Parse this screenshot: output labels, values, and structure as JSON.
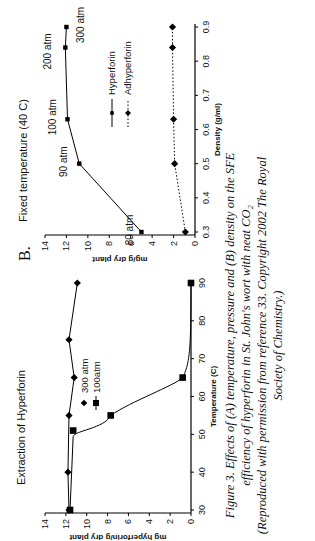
{
  "chart_data": [
    {
      "panel": "A",
      "type": "line",
      "title": "Extraction of Hyperforin",
      "xlabel": "Temperature (C)",
      "ylabel": "mg hyperforin/g dry plant",
      "xlim": [
        30,
        90
      ],
      "ylim": [
        0,
        14
      ],
      "xticks": [
        "30",
        "40",
        "50",
        "60",
        "70",
        "80",
        "90"
      ],
      "yticks": [
        "0",
        "2",
        "4",
        "6",
        "8",
        "10",
        "12",
        "14"
      ],
      "grid": false,
      "legend_position": "upper right",
      "series": [
        {
          "name": "300 atm",
          "marker": "diamond",
          "x": [
            30,
            40,
            55,
            65,
            75,
            90
          ],
          "y": [
            11.7,
            11.8,
            11.7,
            11.2,
            11.7,
            10.9
          ]
        },
        {
          "name": "100atm",
          "marker": "square",
          "x": [
            30,
            51,
            55,
            65,
            90
          ],
          "y": [
            11.6,
            11.3,
            7.7,
            0.8,
            0.0
          ]
        }
      ]
    },
    {
      "panel": "B",
      "type": "line",
      "title": "Fixed temperature (40 C)",
      "xlabel": "Density (g/ml)",
      "ylabel": "mg/g dry plant",
      "xlim": [
        0.3,
        0.9
      ],
      "ylim": [
        0,
        14
      ],
      "xticks": [
        "0.3",
        "0.4",
        "0.5",
        "0.6",
        "0.7",
        "0.8",
        "0.9"
      ],
      "yticks": [
        "0",
        "2",
        "4",
        "6",
        "8",
        "10",
        "12",
        "14"
      ],
      "grid": false,
      "legend_position": "right",
      "series": [
        {
          "name": "Hyperforin",
          "marker": "square",
          "line": "solid",
          "x": [
            0.3,
            0.5,
            0.63,
            0.84,
            0.9
          ],
          "y": [
            5.0,
            10.8,
            11.9,
            12.1,
            12.0
          ],
          "point_labels": [
            "80 atm",
            "90 atm",
            "100 atm",
            "200 atm",
            "300 atm"
          ]
        },
        {
          "name": "Adhyperforin",
          "marker": "diamond",
          "line": "dotted",
          "x": [
            0.3,
            0.5,
            0.63,
            0.84,
            0.9
          ],
          "y": [
            0.9,
            1.9,
            2.0,
            2.1,
            2.1
          ]
        }
      ]
    }
  ],
  "figure": {
    "panel_b_label": "B.",
    "caption_line1": "Figure 3.  Effects of (A) temperature, pressure and (B) density on the SFE",
    "caption_line2": "efficiency of hyperforin in St. John's wort with neat CO₂",
    "caption_line3": "(Reproduced with permission from reference 33. Copyright 2002 The Royal",
    "caption_line4": "Society of Chemistry.)"
  }
}
